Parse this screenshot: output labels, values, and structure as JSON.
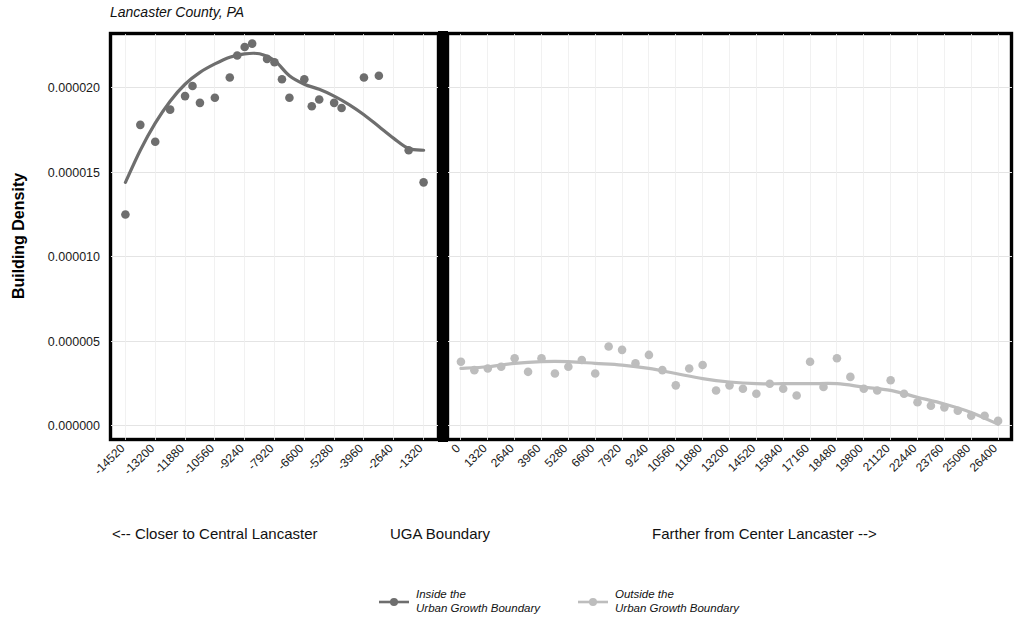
{
  "chart_data": {
    "type": "scatter",
    "title": "Lancaster County, PA",
    "ylabel": "Building Density",
    "xlabel": "",
    "ylim": [
      -8e-07,
      2.32e-05
    ],
    "yticks": [
      0.0,
      5e-06,
      1e-05,
      1.5e-05,
      2e-05
    ],
    "ytick_labels": [
      "0.000000",
      "0.000005",
      "0.000010",
      "0.000015",
      "0.000020"
    ],
    "grid": true,
    "legend_position": "bottom",
    "panels": [
      {
        "name": "inside",
        "caption": "<-- Closer to Central Lancaster",
        "color": "#6e6e6e",
        "xlim": [
          -15180,
          -660
        ],
        "xtick_labels": [
          "-14520",
          "-13200",
          "-11880",
          "-10560",
          "-9240",
          "-7920",
          "-6600",
          "-5280",
          "-3960",
          "-2640",
          "-1320"
        ],
        "xticks": [
          -14520,
          -13200,
          -11880,
          -10560,
          -9240,
          -7920,
          -6600,
          -5280,
          -3960,
          -2640,
          -1320
        ],
        "points": [
          {
            "x": -14520,
            "y": 1.25e-05
          },
          {
            "x": -13860,
            "y": 1.78e-05
          },
          {
            "x": -13200,
            "y": 1.68e-05
          },
          {
            "x": -12540,
            "y": 1.87e-05
          },
          {
            "x": -11880,
            "y": 1.95e-05
          },
          {
            "x": -11550,
            "y": 2.01e-05
          },
          {
            "x": -11220,
            "y": 1.91e-05
          },
          {
            "x": -10560,
            "y": 1.94e-05
          },
          {
            "x": -9900,
            "y": 2.06e-05
          },
          {
            "x": -9570,
            "y": 2.19e-05
          },
          {
            "x": -9240,
            "y": 2.24e-05
          },
          {
            "x": -8910,
            "y": 2.26e-05
          },
          {
            "x": -8250,
            "y": 2.17e-05
          },
          {
            "x": -7920,
            "y": 2.15e-05
          },
          {
            "x": -7590,
            "y": 2.05e-05
          },
          {
            "x": -7260,
            "y": 1.94e-05
          },
          {
            "x": -6600,
            "y": 2.05e-05
          },
          {
            "x": -6270,
            "y": 1.89e-05
          },
          {
            "x": -5940,
            "y": 1.93e-05
          },
          {
            "x": -5280,
            "y": 1.91e-05
          },
          {
            "x": -4950,
            "y": 1.88e-05
          },
          {
            "x": -3960,
            "y": 2.06e-05
          },
          {
            "x": -3300,
            "y": 2.07e-05
          },
          {
            "x": -1980,
            "y": 1.63e-05
          },
          {
            "x": -1320,
            "y": 1.44e-05
          }
        ],
        "fit_line": [
          {
            "x": -14520,
            "y": 1.44e-05
          },
          {
            "x": -13860,
            "y": 1.63e-05
          },
          {
            "x": -13200,
            "y": 1.79e-05
          },
          {
            "x": -12540,
            "y": 1.92e-05
          },
          {
            "x": -11880,
            "y": 2.02e-05
          },
          {
            "x": -11220,
            "y": 2.09e-05
          },
          {
            "x": -10560,
            "y": 2.14e-05
          },
          {
            "x": -9900,
            "y": 2.18e-05
          },
          {
            "x": -9240,
            "y": 2.2e-05
          },
          {
            "x": -8580,
            "y": 2.2e-05
          },
          {
            "x": -7920,
            "y": 2.16e-05
          },
          {
            "x": -7260,
            "y": 2.07e-05
          },
          {
            "x": -6600,
            "y": 2.02e-05
          },
          {
            "x": -5940,
            "y": 1.99e-05
          },
          {
            "x": -5280,
            "y": 1.95e-05
          },
          {
            "x": -4620,
            "y": 1.9e-05
          },
          {
            "x": -3960,
            "y": 1.84e-05
          },
          {
            "x": -3300,
            "y": 1.77e-05
          },
          {
            "x": -2640,
            "y": 1.7e-05
          },
          {
            "x": -1980,
            "y": 1.64e-05
          },
          {
            "x": -1320,
            "y": 1.63e-05
          }
        ]
      },
      {
        "name": "outside",
        "caption": "Farther from Center Lancaster -->",
        "color": "#bdbdbd",
        "xlim": [
          -660,
          27060
        ],
        "xtick_labels": [
          "0",
          "1320",
          "2640",
          "3960",
          "5280",
          "6600",
          "7920",
          "9240",
          "10560",
          "11880",
          "13200",
          "14520",
          "15840",
          "17160",
          "18480",
          "19800",
          "21120",
          "22440",
          "23760",
          "25080",
          "26400"
        ],
        "xticks": [
          0,
          1320,
          2640,
          3960,
          5280,
          6600,
          7920,
          9240,
          10560,
          11880,
          13200,
          14520,
          15840,
          17160,
          18480,
          19800,
          21120,
          22440,
          23760,
          25080,
          26400
        ],
        "points": [
          {
            "x": 0,
            "y": 3.8e-06
          },
          {
            "x": 660,
            "y": 3.3e-06
          },
          {
            "x": 1320,
            "y": 3.4e-06
          },
          {
            "x": 1980,
            "y": 3.5e-06
          },
          {
            "x": 2640,
            "y": 4e-06
          },
          {
            "x": 3300,
            "y": 3.2e-06
          },
          {
            "x": 3960,
            "y": 4e-06
          },
          {
            "x": 4620,
            "y": 3.1e-06
          },
          {
            "x": 5280,
            "y": 3.5e-06
          },
          {
            "x": 5940,
            "y": 3.9e-06
          },
          {
            "x": 6600,
            "y": 3.1e-06
          },
          {
            "x": 7260,
            "y": 4.7e-06
          },
          {
            "x": 7920,
            "y": 4.5e-06
          },
          {
            "x": 8580,
            "y": 3.7e-06
          },
          {
            "x": 9240,
            "y": 4.2e-06
          },
          {
            "x": 9900,
            "y": 3.3e-06
          },
          {
            "x": 10560,
            "y": 2.4e-06
          },
          {
            "x": 11220,
            "y": 3.4e-06
          },
          {
            "x": 11880,
            "y": 3.6e-06
          },
          {
            "x": 12540,
            "y": 2.1e-06
          },
          {
            "x": 13200,
            "y": 2.4e-06
          },
          {
            "x": 13860,
            "y": 2.2e-06
          },
          {
            "x": 14520,
            "y": 1.9e-06
          },
          {
            "x": 15180,
            "y": 2.5e-06
          },
          {
            "x": 15840,
            "y": 2.2e-06
          },
          {
            "x": 16500,
            "y": 1.8e-06
          },
          {
            "x": 17160,
            "y": 3.8e-06
          },
          {
            "x": 17820,
            "y": 2.3e-06
          },
          {
            "x": 18480,
            "y": 4e-06
          },
          {
            "x": 19140,
            "y": 2.9e-06
          },
          {
            "x": 19800,
            "y": 2.2e-06
          },
          {
            "x": 20460,
            "y": 2.1e-06
          },
          {
            "x": 21120,
            "y": 2.7e-06
          },
          {
            "x": 21780,
            "y": 1.9e-06
          },
          {
            "x": 22440,
            "y": 1.4e-06
          },
          {
            "x": 23100,
            "y": 1.2e-06
          },
          {
            "x": 23760,
            "y": 1.1e-06
          },
          {
            "x": 24420,
            "y": 9e-07
          },
          {
            "x": 25080,
            "y": 6e-07
          },
          {
            "x": 25740,
            "y": 6e-07
          },
          {
            "x": 26400,
            "y": 3e-07
          }
        ],
        "fit_line": [
          {
            "x": 0,
            "y": 3.4e-06
          },
          {
            "x": 1320,
            "y": 3.5e-06
          },
          {
            "x": 2640,
            "y": 3.7e-06
          },
          {
            "x": 3960,
            "y": 3.8e-06
          },
          {
            "x": 5280,
            "y": 3.8e-06
          },
          {
            "x": 6600,
            "y": 3.7e-06
          },
          {
            "x": 7920,
            "y": 3.6e-06
          },
          {
            "x": 9240,
            "y": 3.4e-06
          },
          {
            "x": 10560,
            "y": 3.1e-06
          },
          {
            "x": 11880,
            "y": 2.8e-06
          },
          {
            "x": 13200,
            "y": 2.6e-06
          },
          {
            "x": 14520,
            "y": 2.5e-06
          },
          {
            "x": 15840,
            "y": 2.5e-06
          },
          {
            "x": 17160,
            "y": 2.5e-06
          },
          {
            "x": 18480,
            "y": 2.5e-06
          },
          {
            "x": 19800,
            "y": 2.3e-06
          },
          {
            "x": 21120,
            "y": 2.1e-06
          },
          {
            "x": 22440,
            "y": 1.7e-06
          },
          {
            "x": 23760,
            "y": 1.3e-06
          },
          {
            "x": 25080,
            "y": 8e-07
          },
          {
            "x": 26400,
            "y": 1e-07
          }
        ]
      }
    ],
    "boundary_caption": "UGA Boundary",
    "legend": [
      {
        "key": "inside",
        "line1": "Inside the",
        "line2": "Urban Growth Boundary",
        "color": "#6e6e6e"
      },
      {
        "key": "outside",
        "line1": "Outside the",
        "line2": "Urban Growth Boundary",
        "color": "#bdbdbd"
      }
    ]
  }
}
